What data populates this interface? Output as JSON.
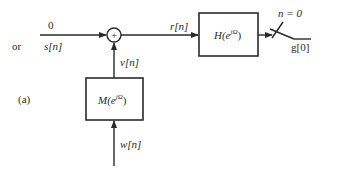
{
  "diagram": {
    "panel_label": "(a)",
    "input": {
      "label_top": "0",
      "label_or": "or",
      "label_bottom": "s[n]"
    },
    "summer": {
      "symbol": "+"
    },
    "sum_output_label": "r[n]",
    "filter_h": {
      "label": "H(e",
      "exp": "jΩ",
      "close": ")"
    },
    "filter_m": {
      "label": "M(e",
      "exp": "jΩ",
      "close": ")"
    },
    "m_output_label": "v[n]",
    "m_input_label": "w[n]",
    "sampler": {
      "label": "n = 0"
    },
    "output_label": "g[0]"
  }
}
